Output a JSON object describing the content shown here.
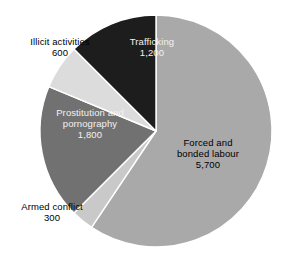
{
  "chart_data": {
    "type": "pie",
    "title": "",
    "subtitle": "",
    "xlabel": "",
    "ylabel": "",
    "legend_position": "none",
    "labels_inline": true,
    "total": 9600,
    "units": "thousands of children",
    "categories": [
      "Forced and bonded labour",
      "Prostitution and pornography",
      "Trafficking",
      "Illicit activities",
      "Armed conflict"
    ],
    "values": [
      5700,
      1800,
      1200,
      600,
      300
    ],
    "slices": [
      {
        "id": "forced",
        "label_line1": "Forced and",
        "label_line2": "bonded labour",
        "value_text": "5,700",
        "value": 5700,
        "percent": 59.4,
        "angle_deg": 213.75,
        "start_deg": 0,
        "end_deg": 213.75,
        "color": "#a9a9a9",
        "text_color": "#000000"
      },
      {
        "id": "armed-conflict",
        "label_line1": "Armed conflict",
        "label_line2": "",
        "value_text": "300",
        "value": 300,
        "percent": 3.1,
        "angle_deg": 11.25,
        "start_deg": 213.75,
        "end_deg": 225.0,
        "color": "#c9c9c9",
        "text_color": "#000000"
      },
      {
        "id": "prostitution",
        "label_line1": "Prostitution and",
        "label_line2": "pornography",
        "value_text": "1,800",
        "value": 1800,
        "percent": 18.8,
        "angle_deg": 67.5,
        "start_deg": 225.0,
        "end_deg": 292.5,
        "color": "#717171",
        "text_color": "#f2f2f2"
      },
      {
        "id": "illicit",
        "label_line1": "Illicit activities",
        "label_line2": "",
        "value_text": "600",
        "value": 600,
        "percent": 6.3,
        "angle_deg": 22.5,
        "start_deg": 292.5,
        "end_deg": 315.0,
        "color": "#dcdcdc",
        "text_color": "#000000"
      },
      {
        "id": "trafficking",
        "label_line1": "Trafficking",
        "label_line2": "",
        "value_text": "1,200",
        "value": 1200,
        "percent": 12.5,
        "angle_deg": 45.0,
        "start_deg": 315.0,
        "end_deg": 360.0,
        "color": "#1d1d1d",
        "text_color": "#f2f2f2"
      }
    ],
    "geometry": {
      "center_x": 156,
      "center_y": 131,
      "radius": 116
    },
    "colors": {
      "background": "#ffffff",
      "outline": "#ffffff",
      "forced": "#a9a9a9",
      "armed_conflict": "#c9c9c9",
      "prostitution": "#717171",
      "illicit": "#dcdcdc",
      "trafficking": "#1d1d1d"
    }
  }
}
